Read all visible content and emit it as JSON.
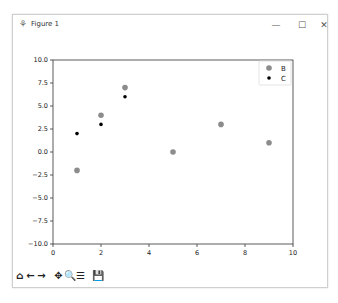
{
  "window": {
    "title": "Figure 1",
    "icon": "matplotlib-icon",
    "controls": {
      "minimize": "—",
      "maximize": "☐",
      "close": "✕"
    }
  },
  "toolbar": {
    "buttons": [
      {
        "name": "home-icon",
        "glyph": "⌂"
      },
      {
        "name": "back-arrow-icon",
        "glyph": "←"
      },
      {
        "name": "forward-arrow-icon",
        "glyph": "→"
      },
      {
        "name": "pan-icon",
        "glyph": "✥"
      },
      {
        "name": "zoom-icon",
        "glyph": "🔍"
      },
      {
        "name": "configure-subplots-icon",
        "glyph": "☰"
      },
      {
        "name": "save-icon",
        "glyph": "💾"
      }
    ]
  },
  "chart_data": {
    "type": "scatter",
    "title": "",
    "xlabel": "",
    "ylabel": "",
    "xlim": [
      0,
      10
    ],
    "ylim": [
      -10,
      10
    ],
    "xticks": [
      "0",
      "2",
      "4",
      "6",
      "8",
      "10"
    ],
    "yticks": [
      "10.0",
      "7.5",
      "5.0",
      "2.5",
      "0.0",
      "−2.5",
      "−5.0",
      "−7.5",
      "−10.0"
    ],
    "grid": false,
    "legend_position": "upper right",
    "series": [
      {
        "name": "B",
        "color": "#8c8c8c",
        "marker_size": 5,
        "x": [
          1,
          2,
          3,
          5,
          7,
          9
        ],
        "y": [
          -2,
          4,
          7,
          0,
          3,
          1
        ]
      },
      {
        "name": "C",
        "color": "#000000",
        "marker_size": 3,
        "x": [
          1,
          2,
          3
        ],
        "y": [
          2,
          3,
          6
        ]
      }
    ]
  }
}
